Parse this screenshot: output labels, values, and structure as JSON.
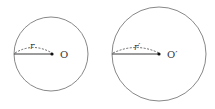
{
  "circles": [
    {
      "center_label": "O",
      "radius_label": "r"
    },
    {
      "center_label": "O′",
      "radius_label": "r′"
    }
  ]
}
